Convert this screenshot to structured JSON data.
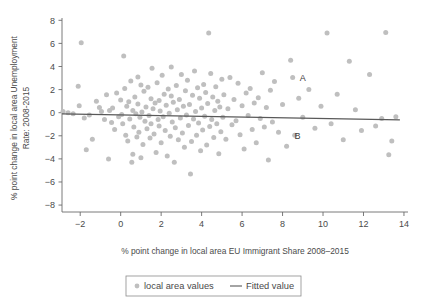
{
  "chart_data": {
    "type": "scatter",
    "title": "",
    "xlabel": "% point change in local area EU Immigrant Share 2008–2015",
    "ylabel_line1": "% point change in local area Unemployment",
    "ylabel_line2": "Rate: 2008-2015",
    "xlim": [
      -2.9,
      14.2
    ],
    "ylim": [
      -8.6,
      8.2
    ],
    "xticks": [
      -2,
      0,
      2,
      4,
      6,
      8,
      10,
      12,
      14
    ],
    "xtick_labels": [
      "−2",
      "0",
      "2",
      "4",
      "6",
      "8",
      "10",
      "12",
      "14"
    ],
    "yticks": [
      8,
      6,
      4,
      2,
      0,
      -2,
      -4,
      -6,
      -8
    ],
    "ytick_labels": [
      "8",
      "6",
      "4",
      "2",
      "0",
      "−2",
      "−4",
      "−6",
      "−8"
    ],
    "grid": false,
    "legend_position": "below-center",
    "marker_color": "#bfbfbf",
    "line_color": "#595959",
    "axis_color": "#6b6b6b",
    "series": [
      {
        "name": "local area values",
        "type": "scatter",
        "marker": "circle",
        "points": [
          [
            -2.85,
            0.1
          ],
          [
            -2.6,
            0.0
          ],
          [
            -2.35,
            -0.1
          ],
          [
            -2.1,
            2.3
          ],
          [
            -2.05,
            0.6
          ],
          [
            -1.95,
            6.05
          ],
          [
            -1.8,
            -0.45
          ],
          [
            -1.7,
            -3.2
          ],
          [
            -1.55,
            -0.2
          ],
          [
            -1.4,
            -2.3
          ],
          [
            -1.2,
            1.0
          ],
          [
            -1.05,
            0.45
          ],
          [
            -0.95,
            0.1
          ],
          [
            -0.8,
            -0.6
          ],
          [
            -0.7,
            1.55
          ],
          [
            -0.6,
            -4.0
          ],
          [
            -0.55,
            0.2
          ],
          [
            -0.45,
            -0.85
          ],
          [
            -0.4,
            0.4
          ],
          [
            -0.3,
            -1.45
          ],
          [
            -0.2,
            1.7
          ],
          [
            -0.1,
            -0.35
          ],
          [
            0.0,
            1.1
          ],
          [
            0.05,
            -0.15
          ],
          [
            0.1,
            -0.95
          ],
          [
            0.15,
            4.9
          ],
          [
            0.2,
            2.1
          ],
          [
            0.25,
            -1.95
          ],
          [
            0.3,
            0.55
          ],
          [
            0.35,
            -2.45
          ],
          [
            0.4,
            0.95
          ],
          [
            0.45,
            -0.55
          ],
          [
            0.5,
            2.75
          ],
          [
            0.55,
            -4.3
          ],
          [
            0.6,
            -3.6
          ],
          [
            0.6,
            0.2
          ],
          [
            0.65,
            -1.25
          ],
          [
            0.7,
            1.35
          ],
          [
            0.75,
            -0.1
          ],
          [
            0.8,
            -2.1
          ],
          [
            0.85,
            3.1
          ],
          [
            0.85,
            0.75
          ],
          [
            0.9,
            -1.7
          ],
          [
            0.95,
            -0.4
          ],
          [
            1.0,
            2.4
          ],
          [
            1.0,
            -3.9
          ],
          [
            1.05,
            0.05
          ],
          [
            1.1,
            -2.75
          ],
          [
            1.15,
            1.85
          ],
          [
            1.2,
            -0.75
          ],
          [
            1.25,
            0.5
          ],
          [
            1.3,
            -1.4
          ],
          [
            1.35,
            2.2
          ],
          [
            1.4,
            -0.25
          ],
          [
            1.45,
            -2.2
          ],
          [
            1.5,
            1.2
          ],
          [
            1.5,
            -0.95
          ],
          [
            1.55,
            3.85
          ],
          [
            1.6,
            0.35
          ],
          [
            1.65,
            -1.85
          ],
          [
            1.7,
            0.85
          ],
          [
            1.75,
            -3.45
          ],
          [
            1.8,
            2.6
          ],
          [
            1.85,
            -0.6
          ],
          [
            1.9,
            1.05
          ],
          [
            1.9,
            -1.15
          ],
          [
            1.95,
            0.15
          ],
          [
            2.0,
            -2.6
          ],
          [
            2.05,
            3.25
          ],
          [
            2.1,
            -0.35
          ],
          [
            2.15,
            1.6
          ],
          [
            2.2,
            -1.55
          ],
          [
            2.25,
            0.65
          ],
          [
            2.3,
            -3.75
          ],
          [
            2.35,
            2.05
          ],
          [
            2.4,
            -0.05
          ],
          [
            2.45,
            -2.05
          ],
          [
            2.5,
            1.45
          ],
          [
            2.5,
            3.95
          ],
          [
            2.55,
            -0.8
          ],
          [
            2.6,
            0.9
          ],
          [
            2.65,
            -4.3
          ],
          [
            2.7,
            -1.3
          ],
          [
            2.75,
            2.35
          ],
          [
            2.8,
            0.25
          ],
          [
            2.85,
            -2.35
          ],
          [
            2.9,
            1.15
          ],
          [
            2.95,
            -0.45
          ],
          [
            3.0,
            3.3
          ],
          [
            3.05,
            -1.75
          ],
          [
            3.1,
            0.55
          ],
          [
            3.15,
            -3.0
          ],
          [
            3.2,
            1.9
          ],
          [
            3.25,
            -0.2
          ],
          [
            3.3,
            2.8
          ],
          [
            3.35,
            -1.1
          ],
          [
            3.4,
            0.7
          ],
          [
            3.45,
            -5.3
          ],
          [
            3.5,
            -2.5
          ],
          [
            3.55,
            1.5
          ],
          [
            3.6,
            -0.55
          ],
          [
            3.65,
            3.6
          ],
          [
            3.7,
            0.1
          ],
          [
            3.75,
            -1.95
          ],
          [
            3.8,
            2.15
          ],
          [
            3.85,
            -0.9
          ],
          [
            3.9,
            1.25
          ],
          [
            3.95,
            -3.3
          ],
          [
            4.0,
            0.4
          ],
          [
            4.05,
            -1.5
          ],
          [
            4.1,
            2.45
          ],
          [
            4.15,
            -0.3
          ],
          [
            4.2,
            1.75
          ],
          [
            4.25,
            -2.8
          ],
          [
            4.3,
            0.8
          ],
          [
            4.35,
            6.9
          ],
          [
            4.4,
            -1.2
          ],
          [
            4.45,
            3.4
          ],
          [
            4.5,
            -0.6
          ],
          [
            4.55,
            1.35
          ],
          [
            4.6,
            -2.15
          ],
          [
            4.65,
            0.2
          ],
          [
            4.7,
            2.25
          ],
          [
            4.75,
            -0.95
          ],
          [
            4.8,
            1.0
          ],
          [
            4.85,
            -3.55
          ],
          [
            4.9,
            0.5
          ],
          [
            4.95,
            -1.65
          ],
          [
            5.0,
            2.9
          ],
          [
            5.05,
            -0.4
          ],
          [
            5.1,
            1.55
          ],
          [
            5.2,
            -2.3
          ],
          [
            5.3,
            0.35
          ],
          [
            5.4,
            3.05
          ],
          [
            5.5,
            -1.05
          ],
          [
            5.6,
            1.15
          ],
          [
            5.7,
            -0.7
          ],
          [
            5.8,
            2.55
          ],
          [
            5.9,
            -1.9
          ],
          [
            6.0,
            0.6
          ],
          [
            6.1,
            -3.15
          ],
          [
            6.2,
            1.7
          ],
          [
            6.3,
            -0.25
          ],
          [
            6.4,
            2.1
          ],
          [
            6.5,
            -1.45
          ],
          [
            6.6,
            0.85
          ],
          [
            6.7,
            -2.6
          ],
          [
            6.8,
            1.3
          ],
          [
            6.9,
            -0.5
          ],
          [
            7.0,
            3.45
          ],
          [
            7.1,
            -1.25
          ],
          [
            7.2,
            0.45
          ],
          [
            7.3,
            -4.1
          ],
          [
            7.4,
            1.95
          ],
          [
            7.5,
            -0.8
          ],
          [
            7.6,
            2.7
          ],
          [
            7.8,
            -1.7
          ],
          [
            8.0,
            0.7
          ],
          [
            8.2,
            -2.9
          ],
          [
            8.4,
            4.55
          ],
          [
            8.5,
            3.05
          ],
          [
            8.6,
            -1.95
          ],
          [
            8.8,
            1.25
          ],
          [
            9.0,
            -0.4
          ],
          [
            9.3,
            2.0
          ],
          [
            9.6,
            -1.35
          ],
          [
            9.9,
            0.55
          ],
          [
            10.2,
            6.9
          ],
          [
            10.4,
            -0.95
          ],
          [
            10.7,
            1.6
          ],
          [
            11.0,
            -2.35
          ],
          [
            11.3,
            4.45
          ],
          [
            11.6,
            0.25
          ],
          [
            11.9,
            -1.55
          ],
          [
            12.3,
            3.3
          ],
          [
            12.6,
            -1.15
          ],
          [
            12.9,
            -0.5
          ],
          [
            13.1,
            6.95
          ],
          [
            13.25,
            -3.65
          ],
          [
            13.4,
            -2.45
          ],
          [
            13.6,
            -0.35
          ]
        ]
      },
      {
        "name": "Fitted value",
        "type": "line",
        "endpoints": [
          [
            -2.9,
            -0.1
          ],
          [
            13.8,
            -0.62
          ]
        ]
      }
    ],
    "annotations": [
      {
        "text": "A",
        "x": 8.5,
        "y": 3.05,
        "label_dx": 7,
        "label_dy": 1
      },
      {
        "text": "B",
        "x": 8.2,
        "y": -1.9,
        "label_dx": 8,
        "label_dy": 1
      }
    ],
    "legend": {
      "items": [
        {
          "label": "local area values",
          "kind": "marker"
        },
        {
          "label": "Fitted value",
          "kind": "line"
        }
      ]
    }
  }
}
